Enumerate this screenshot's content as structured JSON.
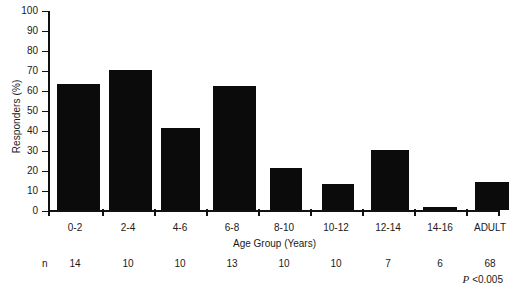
{
  "chart_data": {
    "type": "bar",
    "title": "",
    "xlabel": "Age Group (Years)",
    "ylabel": "Responders (%)",
    "categories": [
      "0-2",
      "2-4",
      "4-6",
      "6-8",
      "8-10",
      "10-12",
      "12-14",
      "14-16",
      "ADULT"
    ],
    "values": [
      63,
      70,
      41,
      62,
      21,
      13,
      30,
      1.5,
      14
    ],
    "ylim": [
      0,
      100
    ],
    "yticks": [
      0,
      10,
      20,
      30,
      40,
      50,
      60,
      70,
      80,
      90,
      100
    ],
    "grid": false,
    "legend": false,
    "bar_color": "#0b0b0b",
    "annotations": {
      "n_label": "n",
      "n_values": [
        "14",
        "10",
        "10",
        "13",
        "10",
        "10",
        "7",
        "6",
        "68"
      ],
      "p_symbol": "P",
      "p_text": "<0.005"
    }
  }
}
